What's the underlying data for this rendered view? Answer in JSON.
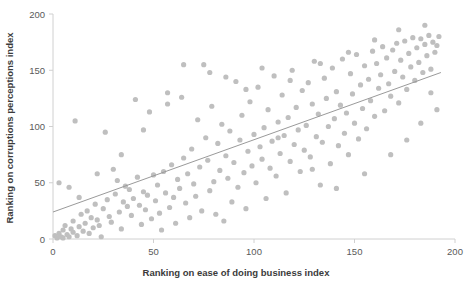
{
  "chart_data": {
    "type": "scatter",
    "title": "",
    "xlabel": "Ranking on ease of doing business index",
    "ylabel": "Ranking on corruptions perceptions index",
    "xlim": [
      0,
      200
    ],
    "ylim": [
      0,
      200
    ],
    "xticks": [
      0,
      50,
      100,
      150,
      200
    ],
    "yticks": [
      0,
      50,
      100,
      150,
      200
    ],
    "xtick_labels": [
      "0",
      "50",
      "100",
      "150",
      "200"
    ],
    "ytick_labels": [
      "0",
      "50",
      "100",
      "150",
      "200"
    ],
    "grid": false,
    "legend": false,
    "point_color": "#bfbfbf",
    "trendline_color": "#9a9a9a",
    "axis_color": "#d0d0d0",
    "text_color": "#3b3b3b",
    "trendline": {
      "x": [
        0,
        193
      ],
      "y": [
        24,
        148
      ]
    },
    "series": [
      {
        "name": "countries",
        "points": [
          [
            1,
            3
          ],
          [
            2,
            1
          ],
          [
            3,
            5
          ],
          [
            3,
            50
          ],
          [
            4,
            2
          ],
          [
            5,
            8
          ],
          [
            5,
            1
          ],
          [
            6,
            12
          ],
          [
            7,
            4
          ],
          [
            8,
            2
          ],
          [
            8,
            46
          ],
          [
            9,
            9
          ],
          [
            10,
            16
          ],
          [
            10,
            6
          ],
          [
            11,
            105
          ],
          [
            12,
            3
          ],
          [
            13,
            11
          ],
          [
            14,
            22
          ],
          [
            15,
            7
          ],
          [
            16,
            14
          ],
          [
            17,
            25
          ],
          [
            18,
            5
          ],
          [
            19,
            19
          ],
          [
            20,
            10
          ],
          [
            21,
            31
          ],
          [
            22,
            17
          ],
          [
            23,
            12
          ],
          [
            24,
            2
          ],
          [
            25,
            27
          ],
          [
            26,
            95
          ],
          [
            27,
            35
          ],
          [
            28,
            20
          ],
          [
            29,
            15
          ],
          [
            30,
            62
          ],
          [
            31,
            40
          ],
          [
            32,
            52
          ],
          [
            33,
            24
          ],
          [
            34,
            9
          ],
          [
            35,
            33
          ],
          [
            36,
            47
          ],
          [
            37,
            29
          ],
          [
            38,
            44
          ],
          [
            39,
            21
          ],
          [
            40,
            36
          ],
          [
            41,
            124
          ],
          [
            42,
            55
          ],
          [
            43,
            30
          ],
          [
            44,
            13
          ],
          [
            45,
            42
          ],
          [
            46,
            26
          ],
          [
            47,
            39
          ],
          [
            48,
            113
          ],
          [
            49,
            18
          ],
          [
            50,
            57
          ],
          [
            51,
            34
          ],
          [
            52,
            48
          ],
          [
            53,
            23
          ],
          [
            54,
            8
          ],
          [
            55,
            60
          ],
          [
            56,
            41
          ],
          [
            57,
            130
          ],
          [
            58,
            28
          ],
          [
            59,
            66
          ],
          [
            60,
            37
          ],
          [
            61,
            14
          ],
          [
            62,
            53
          ],
          [
            63,
            45
          ],
          [
            64,
            126
          ],
          [
            65,
            72
          ],
          [
            66,
            32
          ],
          [
            67,
            58
          ],
          [
            68,
            19
          ],
          [
            69,
            80
          ],
          [
            70,
            49
          ],
          [
            71,
            38
          ],
          [
            72,
            106
          ],
          [
            73,
            64
          ],
          [
            74,
            25
          ],
          [
            75,
            155
          ],
          [
            76,
            90
          ],
          [
            77,
            70
          ],
          [
            78,
            43
          ],
          [
            79,
            118
          ],
          [
            80,
            51
          ],
          [
            81,
            22
          ],
          [
            82,
            85
          ],
          [
            83,
            61
          ],
          [
            84,
            102
          ],
          [
            85,
            16
          ],
          [
            86,
            74
          ],
          [
            87,
            54
          ],
          [
            88,
            96
          ],
          [
            89,
            33
          ],
          [
            90,
            68
          ],
          [
            91,
            140
          ],
          [
            92,
            46
          ],
          [
            93,
            88
          ],
          [
            94,
            110
          ],
          [
            95,
            59
          ],
          [
            96,
            27
          ],
          [
            97,
            78
          ],
          [
            98,
            122
          ],
          [
            99,
            65
          ],
          [
            100,
            93
          ],
          [
            101,
            50
          ],
          [
            102,
            135
          ],
          [
            103,
            82
          ],
          [
            104,
            71
          ],
          [
            105,
            99
          ],
          [
            106,
            36
          ],
          [
            107,
            115
          ],
          [
            108,
            63
          ],
          [
            109,
            87
          ],
          [
            110,
            145
          ],
          [
            111,
            56
          ],
          [
            112,
            104
          ],
          [
            113,
            76
          ],
          [
            114,
            128
          ],
          [
            115,
            92
          ],
          [
            116,
            41
          ],
          [
            117,
            108
          ],
          [
            118,
            69
          ],
          [
            119,
            150
          ],
          [
            120,
            84
          ],
          [
            121,
            117
          ],
          [
            122,
            97
          ],
          [
            123,
            60
          ],
          [
            124,
            132
          ],
          [
            125,
            79
          ],
          [
            126,
            101
          ],
          [
            127,
            139
          ],
          [
            128,
            73
          ],
          [
            129,
            120
          ],
          [
            130,
            158
          ],
          [
            131,
            91
          ],
          [
            132,
            111
          ],
          [
            133,
            48
          ],
          [
            134,
            86
          ],
          [
            135,
            143
          ],
          [
            136,
            125
          ],
          [
            137,
            100
          ],
          [
            138,
            67
          ],
          [
            139,
            152
          ],
          [
            140,
            107
          ],
          [
            141,
            131
          ],
          [
            142,
            83
          ],
          [
            143,
            119
          ],
          [
            144,
            160
          ],
          [
            145,
            94
          ],
          [
            146,
            112
          ],
          [
            147,
            75
          ],
          [
            148,
            147
          ],
          [
            149,
            129
          ],
          [
            150,
            103
          ],
          [
            151,
            164
          ],
          [
            152,
            89
          ],
          [
            153,
            137
          ],
          [
            154,
            116
          ],
          [
            155,
            154
          ],
          [
            156,
            98
          ],
          [
            157,
            142
          ],
          [
            158,
            123
          ],
          [
            159,
            167
          ],
          [
            160,
            109
          ],
          [
            161,
            156
          ],
          [
            162,
            134
          ],
          [
            163,
            146
          ],
          [
            164,
            171
          ],
          [
            165,
            114
          ],
          [
            166,
            161
          ],
          [
            167,
            138
          ],
          [
            168,
            127
          ],
          [
            169,
            168
          ],
          [
            170,
            149
          ],
          [
            171,
            174
          ],
          [
            172,
            121
          ],
          [
            173,
            159
          ],
          [
            174,
            144
          ],
          [
            175,
            176
          ],
          [
            176,
            133
          ],
          [
            177,
            165
          ],
          [
            178,
            153
          ],
          [
            179,
            179
          ],
          [
            180,
            141
          ],
          [
            181,
            170
          ],
          [
            182,
            157
          ],
          [
            183,
            178
          ],
          [
            184,
            148
          ],
          [
            185,
            173
          ],
          [
            186,
            163
          ],
          [
            187,
            181
          ],
          [
            188,
            151
          ],
          [
            189,
            175
          ],
          [
            190,
            166
          ],
          [
            191,
            172
          ],
          [
            192,
            180
          ],
          [
            65,
            155
          ],
          [
            78,
            148
          ],
          [
            96,
            133
          ],
          [
            112,
            90
          ],
          [
            129,
            62
          ],
          [
            141,
            45
          ],
          [
            155,
            58
          ],
          [
            168,
            75
          ],
          [
            176,
            88
          ],
          [
            183,
            103
          ],
          [
            188,
            130
          ],
          [
            191,
            115
          ],
          [
            86,
            144
          ],
          [
            104,
            152
          ],
          [
            118,
            141
          ],
          [
            133,
            156
          ],
          [
            147,
            166
          ],
          [
            160,
            177
          ],
          [
            172,
            186
          ],
          [
            185,
            190
          ],
          [
            45,
            97
          ],
          [
            57,
            120
          ],
          [
            34,
            75
          ],
          [
            22,
            58
          ],
          [
            13,
            37
          ]
        ]
      }
    ]
  }
}
